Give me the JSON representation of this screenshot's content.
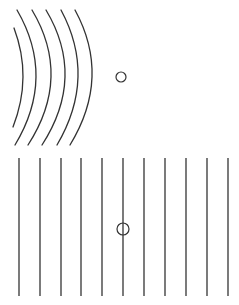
{
  "figure": {
    "width": 239,
    "height": 305,
    "stroke_color": "#333333",
    "background": "#ffffff"
  },
  "top_panel": {
    "description": "curved wavefronts with a small circle (object) to the right",
    "wavefronts": [
      {
        "start": [
          14,
          28
        ],
        "control": [
          32.5,
          77
        ],
        "end": [
          13,
          127
        ]
      },
      {
        "start": [
          17,
          10
        ],
        "control": [
          56,
          77
        ],
        "end": [
          15,
          145
        ]
      },
      {
        "start": [
          32,
          10
        ],
        "control": [
          72,
          77
        ],
        "end": [
          28,
          145
        ]
      },
      {
        "start": [
          46,
          10
        ],
        "control": [
          86,
          77
        ],
        "end": [
          42,
          145
        ]
      },
      {
        "start": [
          61,
          10
        ],
        "control": [
          97,
          77
        ],
        "end": [
          57,
          145
        ]
      },
      {
        "start": [
          75,
          10
        ],
        "control": [
          111.5,
          77
        ],
        "end": [
          70,
          145
        ]
      }
    ],
    "circle": {
      "cx": 121,
      "cy": 77,
      "r": 5
    }
  },
  "bottom_panel": {
    "description": "straight parallel wavefronts with a small circle on one line",
    "lines_x": [
      19,
      40,
      61,
      81,
      102,
      123,
      144,
      165,
      186,
      207,
      228
    ],
    "y_top": 158,
    "y_bottom": 296,
    "circle": {
      "cx": 123,
      "cy": 229,
      "r": 6
    }
  }
}
